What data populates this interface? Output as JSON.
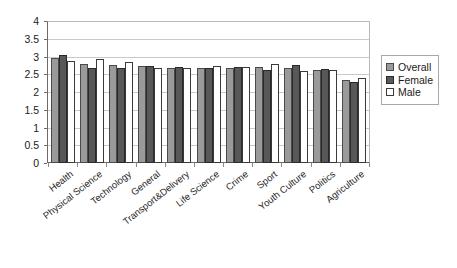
{
  "chart_data": {
    "type": "bar",
    "title": "",
    "subtitle": "",
    "xlabel": "",
    "ylabel": "",
    "ylim": [
      0,
      4
    ],
    "ytick_step": 0.5,
    "ytick_labels": [
      "0",
      "0.5",
      "1",
      "1.5",
      "2",
      "2.5",
      "3",
      "3.5",
      "4"
    ],
    "grid": "horizontal",
    "legend_position": "right",
    "categories": [
      "Health",
      "Physical Science",
      "Technology",
      "General",
      "Transport&Delivery",
      "Life Science",
      "Crime",
      "Sport",
      "Youth Culture",
      "Politics",
      "Agriculture"
    ],
    "series": [
      {
        "name": "Overall",
        "color": "#9a9a9a",
        "values": [
          2.96,
          2.78,
          2.75,
          2.73,
          2.68,
          2.68,
          2.69,
          2.7,
          2.68,
          2.63,
          2.33
        ]
      },
      {
        "name": "Female",
        "color": "#585858",
        "values": [
          3.04,
          2.67,
          2.68,
          2.74,
          2.7,
          2.69,
          2.7,
          2.63,
          2.75,
          2.64,
          2.29
        ]
      },
      {
        "name": "Male",
        "color": "#ffffff",
        "values": [
          2.87,
          2.92,
          2.84,
          2.69,
          2.69,
          2.72,
          2.7,
          2.78,
          2.58,
          2.62,
          2.4
        ]
      }
    ]
  },
  "legend": {
    "items": [
      {
        "label": "Overall",
        "swatch": "overall"
      },
      {
        "label": "Female",
        "swatch": "female"
      },
      {
        "label": "Male",
        "swatch": "male"
      }
    ]
  }
}
